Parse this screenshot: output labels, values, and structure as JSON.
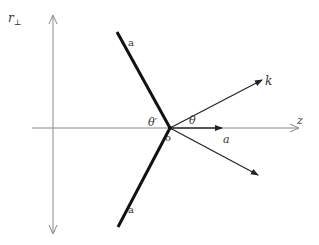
{
  "diagram": {
    "type": "vector-geometry",
    "axes": {
      "vertical": {
        "label_main": "r",
        "label_sub": "⊥",
        "color": "#888888"
      },
      "horizontal": {
        "label": "z",
        "color": "#888888"
      }
    },
    "origin_label": "o",
    "line_labels": {
      "upper": "a",
      "lower": "a"
    },
    "vector_labels": {
      "k": "k",
      "a": "a"
    },
    "angle_labels": {
      "theta": "θ",
      "theta_prime": "θ′"
    },
    "colors": {
      "thick_line": "#111111",
      "vector": "#222222",
      "axis": "#8a8a8a",
      "text": "#333333"
    },
    "geometry": {
      "origin": [
        170,
        128
      ],
      "vertical_axis": {
        "x": 53,
        "y_top": 15,
        "y_bottom": 233
      },
      "horizontal_axis": {
        "y": 128,
        "x_left": 32,
        "x_right": 298
      },
      "thick_line_upper_end": [
        117,
        32
      ],
      "thick_line_lower_end": [
        118,
        227
      ],
      "vector_k_end": [
        262,
        80
      ],
      "vector_lower_end": [
        258,
        175
      ],
      "vector_a_end": [
        222,
        128
      ]
    }
  }
}
